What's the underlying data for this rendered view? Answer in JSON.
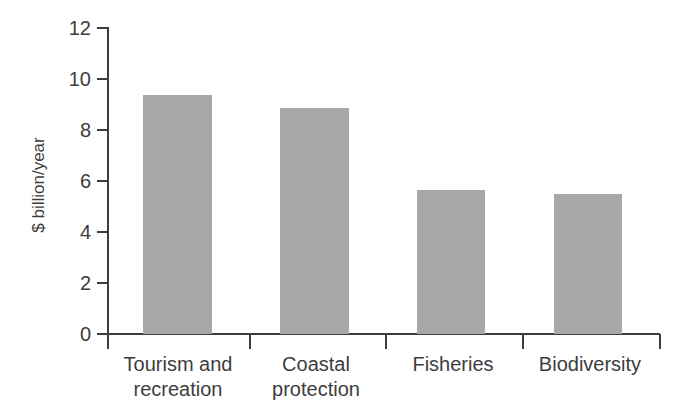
{
  "chart_data": {
    "type": "bar",
    "title": "",
    "subtitle": "",
    "xlabel": "",
    "ylabel": "$ billion/year",
    "categories": [
      "Tourism and recreation",
      "Coastal protection",
      "Fisheries",
      "Biodiversity"
    ],
    "category_lines": [
      [
        "Tourism and",
        "recreation"
      ],
      [
        "Coastal",
        "protection"
      ],
      [
        "Fisheries"
      ],
      [
        "Biodiversity"
      ]
    ],
    "values": [
      9.65,
      9.0,
      5.7,
      5.5
    ],
    "ylim": [
      0,
      12
    ],
    "yticks": [
      0,
      2,
      4,
      6,
      8,
      10,
      12
    ],
    "ytick_labels": [
      "0",
      "2",
      "4",
      "6",
      "8",
      "10",
      "12"
    ],
    "grid": false,
    "legend": null,
    "bar_color": "#a8a8a8",
    "axis_color": "#3d3d3d",
    "background_color": "#ffffff",
    "annotations": []
  }
}
